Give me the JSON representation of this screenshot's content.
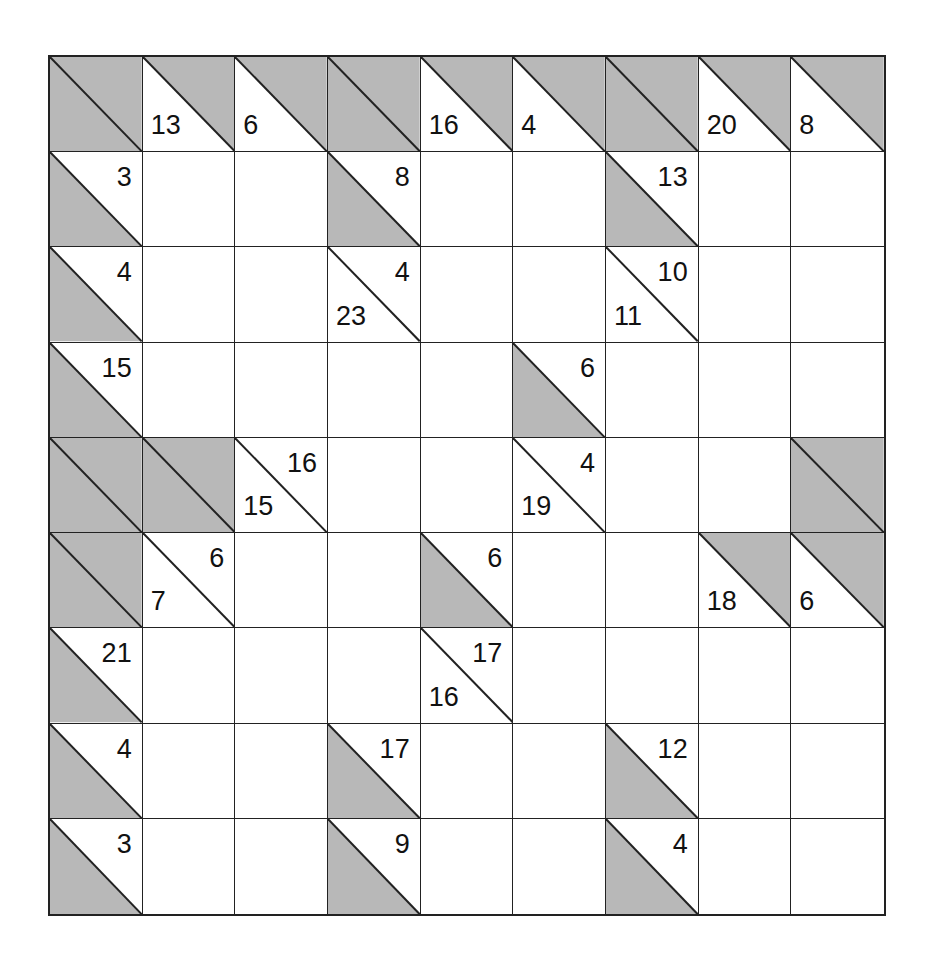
{
  "puzzle": {
    "type": "Kakuro",
    "rows": 9,
    "cols": 9,
    "colors": {
      "shade": "#b8b8b8",
      "line": "#222222",
      "blank": "#ffffff"
    },
    "legend": {
      "X": "blocked cell (fully shaded)",
      "W": "white entry cell",
      "D": "down clue (sum of cells below)",
      "A": "across clue (sum of cells to the right)",
      "DA": "both down and across clues"
    },
    "grid": [
      [
        {
          "t": "X"
        },
        {
          "t": "D",
          "down": "13"
        },
        {
          "t": "D",
          "down": "6"
        },
        {
          "t": "X"
        },
        {
          "t": "D",
          "down": "16"
        },
        {
          "t": "D",
          "down": "4"
        },
        {
          "t": "X"
        },
        {
          "t": "D",
          "down": "20"
        },
        {
          "t": "D",
          "down": "8"
        }
      ],
      [
        {
          "t": "A",
          "across": "3"
        },
        {
          "t": "W"
        },
        {
          "t": "W"
        },
        {
          "t": "A",
          "across": "8"
        },
        {
          "t": "W"
        },
        {
          "t": "W"
        },
        {
          "t": "A",
          "across": "13"
        },
        {
          "t": "W"
        },
        {
          "t": "W"
        }
      ],
      [
        {
          "t": "A",
          "across": "4"
        },
        {
          "t": "W"
        },
        {
          "t": "W"
        },
        {
          "t": "DA",
          "down": "23",
          "across": "4"
        },
        {
          "t": "W"
        },
        {
          "t": "W"
        },
        {
          "t": "DA",
          "down": "11",
          "across": "10"
        },
        {
          "t": "W"
        },
        {
          "t": "W"
        }
      ],
      [
        {
          "t": "A",
          "across": "15"
        },
        {
          "t": "W"
        },
        {
          "t": "W"
        },
        {
          "t": "W"
        },
        {
          "t": "W"
        },
        {
          "t": "A",
          "across": "6"
        },
        {
          "t": "W"
        },
        {
          "t": "W"
        },
        {
          "t": "W"
        }
      ],
      [
        {
          "t": "X"
        },
        {
          "t": "X"
        },
        {
          "t": "DA",
          "down": "15",
          "across": "16"
        },
        {
          "t": "W"
        },
        {
          "t": "W"
        },
        {
          "t": "DA",
          "down": "19",
          "across": "4"
        },
        {
          "t": "W"
        },
        {
          "t": "W"
        },
        {
          "t": "X"
        }
      ],
      [
        {
          "t": "X"
        },
        {
          "t": "DA",
          "down": "7",
          "across": "6"
        },
        {
          "t": "W"
        },
        {
          "t": "W"
        },
        {
          "t": "A",
          "across": "6"
        },
        {
          "t": "W"
        },
        {
          "t": "W"
        },
        {
          "t": "D",
          "down": "18"
        },
        {
          "t": "D",
          "down": "6"
        }
      ],
      [
        {
          "t": "A",
          "across": "21"
        },
        {
          "t": "W"
        },
        {
          "t": "W"
        },
        {
          "t": "W"
        },
        {
          "t": "DA",
          "down": "16",
          "across": "17"
        },
        {
          "t": "W"
        },
        {
          "t": "W"
        },
        {
          "t": "W"
        },
        {
          "t": "W"
        }
      ],
      [
        {
          "t": "A",
          "across": "4"
        },
        {
          "t": "W"
        },
        {
          "t": "W"
        },
        {
          "t": "A",
          "across": "17"
        },
        {
          "t": "W"
        },
        {
          "t": "W"
        },
        {
          "t": "A",
          "across": "12"
        },
        {
          "t": "W"
        },
        {
          "t": "W"
        }
      ],
      [
        {
          "t": "A",
          "across": "3"
        },
        {
          "t": "W"
        },
        {
          "t": "W"
        },
        {
          "t": "A",
          "across": "9"
        },
        {
          "t": "W"
        },
        {
          "t": "W"
        },
        {
          "t": "A",
          "across": "4"
        },
        {
          "t": "W"
        },
        {
          "t": "W"
        }
      ]
    ]
  }
}
